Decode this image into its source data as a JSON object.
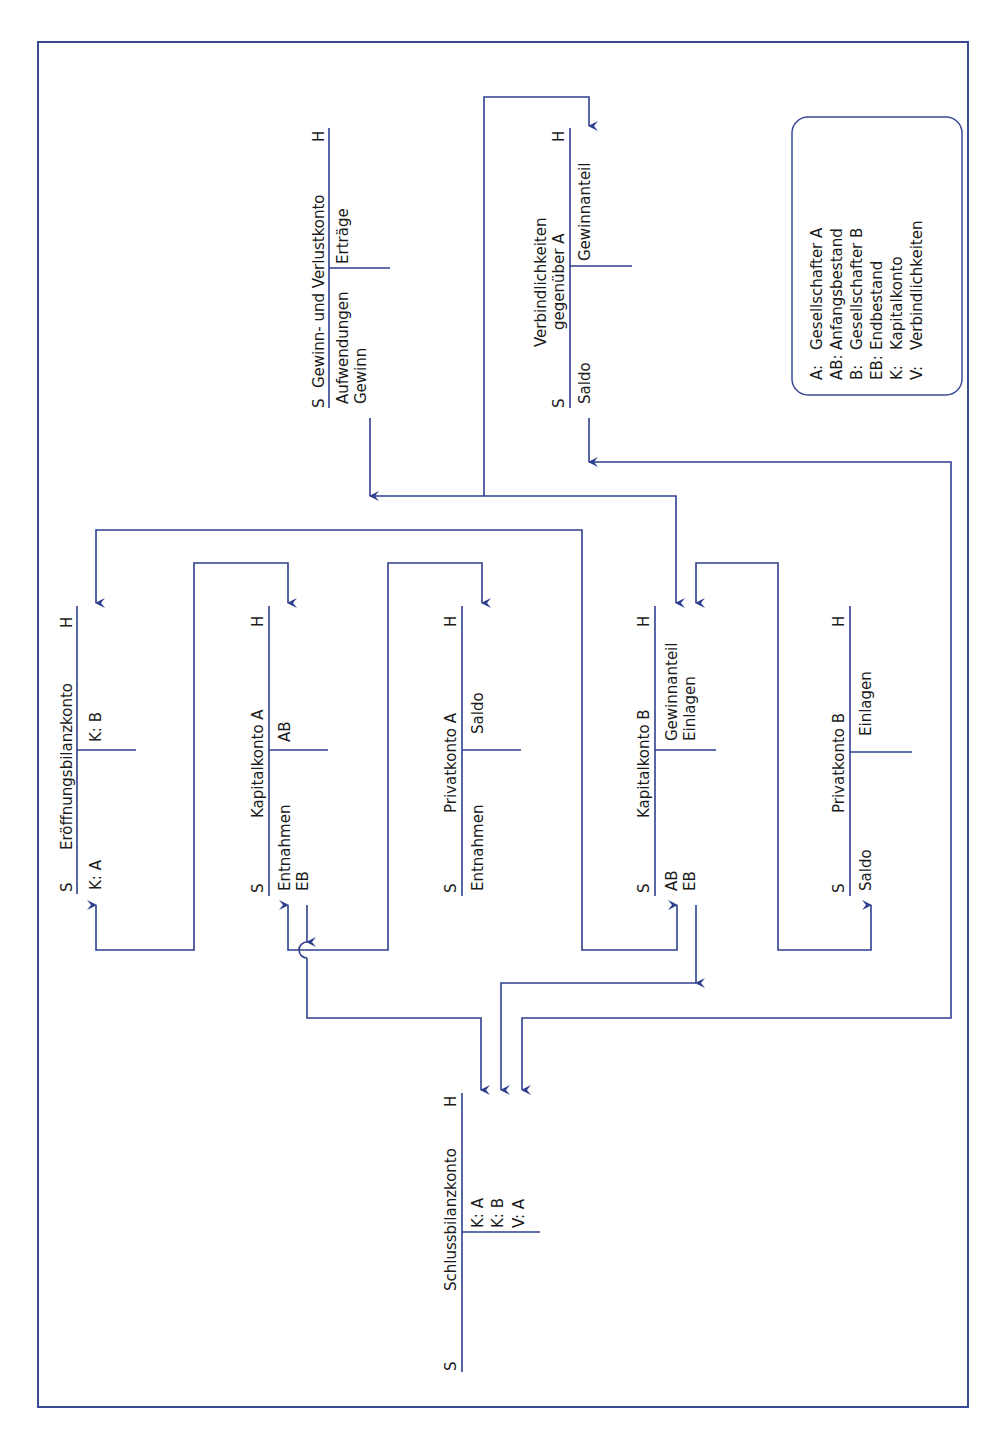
{
  "orientation": "rotated-90-ccw",
  "colors": {
    "line": "#2f3f8f",
    "frame": "#3b4a94",
    "text": "#1a1a1a",
    "background": "#ffffff"
  },
  "legend": {
    "items": [
      {
        "abbr": "A:",
        "meaning": "Gesellschafter A"
      },
      {
        "abbr": "AB:",
        "meaning": "Anfangsbestand"
      },
      {
        "abbr": "B:",
        "meaning": "Gesellschafter B"
      },
      {
        "abbr": "EB:",
        "meaning": "Endbestand"
      },
      {
        "abbr": "K:",
        "meaning": "Kapitalkonto"
      },
      {
        "abbr": "V:",
        "meaning": "Verbindlichkeiten"
      }
    ]
  },
  "accounts": {
    "guv": {
      "side_s": "S",
      "side_h": "H",
      "title": "Gewinn- und Verlustkonto",
      "soll": [
        "Aufwendungen",
        "Gewinn"
      ],
      "haben": [
        "Erträge"
      ]
    },
    "verbindlichkeiten": {
      "side_s": "S",
      "side_h": "H",
      "title_line1": "Verbindlichkeiten",
      "title_line2": "gegenüber A",
      "soll": [
        "Saldo"
      ],
      "haben": [
        "Gewinnanteil"
      ]
    },
    "eroeffnung": {
      "side_s": "S",
      "side_h": "H",
      "title": "Eröffnungsbilanzkonto",
      "soll": [
        "K: A"
      ],
      "haben": [
        "K: B"
      ]
    },
    "kapital_a": {
      "side_s": "S",
      "side_h": "H",
      "title": "Kapitalkonto A",
      "soll": [
        "Entnahmen",
        "EB"
      ],
      "haben": [
        "AB"
      ]
    },
    "privat_a": {
      "side_s": "S",
      "side_h": "H",
      "title": "Privatkonto A",
      "soll": [
        "Entnahmen"
      ],
      "haben": [
        "Saldo"
      ]
    },
    "kapital_b": {
      "side_s": "S",
      "side_h": "H",
      "title": "Kapitalkonto B",
      "soll": [
        "AB",
        "EB"
      ],
      "haben": [
        "Gewinnanteil",
        "Einlagen"
      ]
    },
    "privat_b": {
      "side_s": "S",
      "side_h": "H",
      "title": "Privatkonto B",
      "soll": [
        "Saldo"
      ],
      "haben": [
        "Einlagen"
      ]
    },
    "schluss": {
      "side_s": "S",
      "side_h": "H",
      "title": "Schlussbilanzkonto",
      "soll": [],
      "haben": [
        "K: A",
        "K: B",
        "V: A"
      ]
    }
  }
}
